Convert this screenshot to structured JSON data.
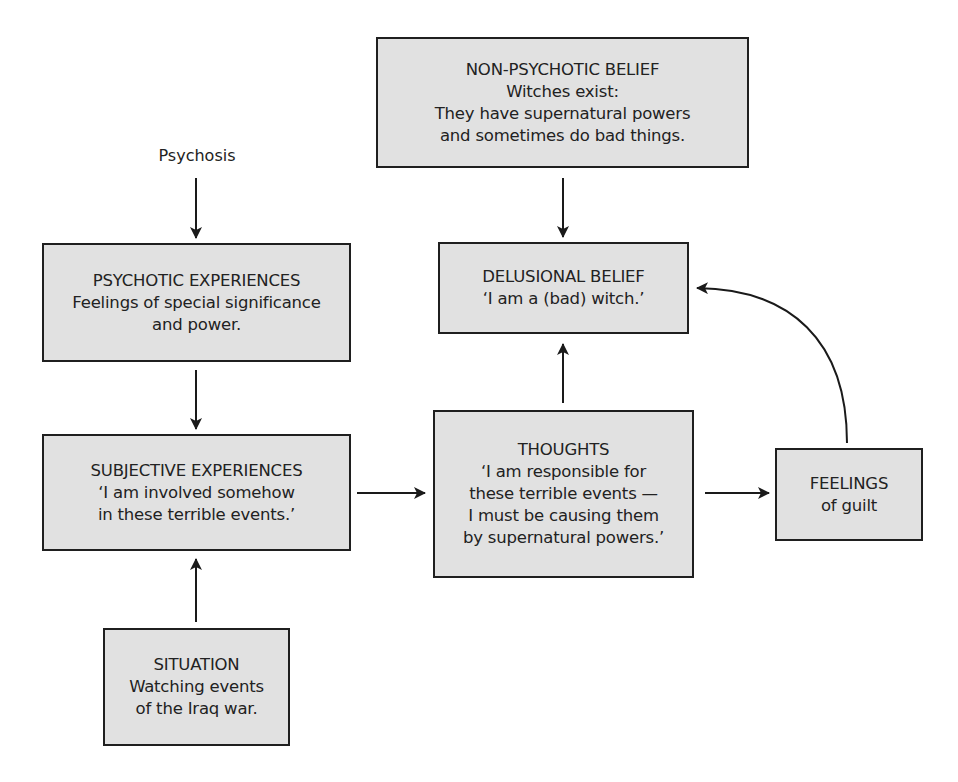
{
  "diagram": {
    "colors": {
      "box_fill": "#e1e1e1",
      "box_border": "#1f1f1f",
      "arrow": "#1a1a1a",
      "text": "#222222",
      "background": "#ffffff"
    },
    "labels": {
      "psychosis": "Psychosis"
    },
    "nodes": {
      "non_psychotic_belief": {
        "title": "NON-PSYCHOTIC BELIEF",
        "lines": [
          "Witches exist:",
          "They have supernatural powers",
          "and sometimes do bad things."
        ]
      },
      "psychotic_experiences": {
        "title": "PSYCHOTIC EXPERIENCES",
        "lines": [
          "Feelings of special significance",
          "and power."
        ]
      },
      "delusional_belief": {
        "title": "DELUSIONAL BELIEF",
        "lines": [
          "‘I am a (bad) witch.’"
        ]
      },
      "subjective_experiences": {
        "title": "SUBJECTIVE EXPERIENCES",
        "lines": [
          "‘I am involved somehow",
          "in these terrible events.’"
        ]
      },
      "thoughts": {
        "title": "THOUGHTS",
        "lines": [
          "‘I am responsible for",
          "these terrible events —",
          "I must be causing them",
          "by supernatural powers.’"
        ]
      },
      "feelings": {
        "title": "FEELINGS",
        "lines": [
          "of guilt"
        ]
      },
      "situation": {
        "title": "SITUATION",
        "lines": [
          "Watching events",
          "of the Iraq war."
        ]
      }
    },
    "edges": [
      {
        "from": "psychosis",
        "to": "psychotic_experiences"
      },
      {
        "from": "psychotic_experiences",
        "to": "subjective_experiences"
      },
      {
        "from": "situation",
        "to": "subjective_experiences"
      },
      {
        "from": "subjective_experiences",
        "to": "thoughts"
      },
      {
        "from": "thoughts",
        "to": "delusional_belief"
      },
      {
        "from": "thoughts",
        "to": "feelings"
      },
      {
        "from": "feelings",
        "to": "delusional_belief"
      },
      {
        "from": "non_psychotic_belief",
        "to": "delusional_belief"
      }
    ]
  }
}
